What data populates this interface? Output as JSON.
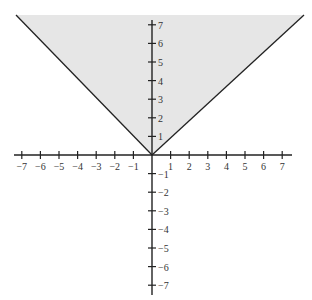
{
  "chart_data": {
    "type": "area",
    "title": "",
    "boundary": {
      "equation": "y = |x|",
      "points": [
        [
          -7.5,
          7.5
        ],
        [
          0,
          0
        ],
        [
          7.5,
          7.5
        ]
      ]
    },
    "shading": {
      "region": "y >= |x|",
      "color": "#e6e6e6"
    },
    "xlabel": "",
    "ylabel": "",
    "xlim": [
      -7,
      7
    ],
    "ylim": [
      -7,
      7
    ],
    "x_ticks": [
      "-7",
      "-6",
      "-5",
      "-4",
      "-3",
      "-2",
      "-1",
      "1",
      "2",
      "3",
      "4",
      "5",
      "6",
      "7"
    ],
    "y_ticks": [
      "7",
      "6",
      "5",
      "4",
      "3",
      "2",
      "1",
      "-1",
      "-2",
      "-3",
      "-4",
      "-5",
      "-6",
      "-7"
    ],
    "grid": false,
    "line_color": "#222222"
  }
}
